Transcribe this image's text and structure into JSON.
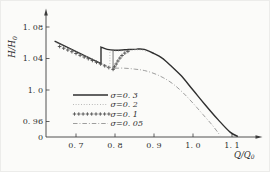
{
  "figure": {
    "background": "#fbfbf9"
  },
  "style": {
    "axis_color": "#3c3c3c",
    "text_color": "#2e2e2e",
    "solid_color": "#2f2f2f",
    "dotted_color": "#a0a0a0",
    "plus_color": "#4f4f4f",
    "dashdot_color": "#8c8c8c"
  },
  "axes": {
    "x": {
      "label": {
        "text": "Q/Q",
        "sub": "0"
      },
      "ticks": [
        {
          "v": 0.7,
          "label": "0. 7"
        },
        {
          "v": 0.8,
          "label": "0. 8"
        },
        {
          "v": 0.9,
          "label": "0. 9"
        },
        {
          "v": 1.0,
          "label": "1. 0"
        },
        {
          "v": 1.1,
          "label": "1. 1"
        }
      ]
    },
    "y": {
      "label": {
        "text": "H/H",
        "sub": "0"
      },
      "ticks": [
        {
          "v": 1.08,
          "label": "1. 08"
        },
        {
          "v": 1.04,
          "label": "1. 04"
        },
        {
          "v": 1.0,
          "label": "1. 0"
        },
        {
          "v": 0.96,
          "label": "0. 96"
        }
      ],
      "origin_label": "0"
    }
  },
  "legend": {
    "entries": [
      {
        "name": "sigma-0-3",
        "style": "solid",
        "label": "σ=0. 3"
      },
      {
        "name": "sigma-0-2",
        "style": "dotted",
        "label": "σ=0. 2"
      },
      {
        "name": "sigma-0-1",
        "style": "plus",
        "label": "σ=0. 1"
      },
      {
        "name": "sigma-0-05",
        "style": "dashdot",
        "label": "σ=0. 05"
      }
    ]
  },
  "chart_data": {
    "type": "line",
    "title": "",
    "xlabel": "Q/Q0",
    "ylabel": "H/H0",
    "x_ticks": [
      0.7,
      0.8,
      0.9,
      1.0,
      1.1
    ],
    "y_ticks": [
      0.96,
      1.0,
      1.04,
      1.08
    ],
    "xlim": [
      0.62,
      1.17
    ],
    "ylim_linear": [
      0.94,
      1.095
    ],
    "y_axis_break_to_zero": true,
    "grid": false,
    "legend_position": "lower-left-inside",
    "series": [
      {
        "name": "σ=0.3",
        "style": "solid",
        "segments": [
          {
            "smooth": false,
            "pts": [
              [
                0.645,
                1.062
              ],
              [
                0.764,
                1.0335
              ]
            ]
          },
          {
            "smooth": false,
            "pts": [
              [
                0.764,
                1.0335
              ],
              [
                0.764,
                1.0545
              ]
            ]
          },
          {
            "smooth": true,
            "pts": [
              [
                0.764,
                1.0545
              ],
              [
                0.78,
                1.0515
              ],
              [
                0.8,
                1.0505
              ],
              [
                0.825,
                1.051
              ],
              [
                0.855,
                1.052
              ],
              [
                0.875,
                1.0515
              ],
              [
                0.9,
                1.0462
              ],
              [
                0.92,
                1.0408
              ],
              [
                0.945,
                1.03
              ],
              [
                0.97,
                1.018
              ],
              [
                1.0,
                1.0
              ],
              [
                1.03,
                0.982
              ],
              [
                1.065,
                0.962
              ],
              [
                1.095,
                0.9465
              ],
              [
                1.115,
                0.941
              ]
            ]
          }
        ]
      },
      {
        "name": "σ=0.2",
        "style": "dotted",
        "segments": [
          {
            "smooth": false,
            "pts": [
              [
                0.65,
                1.0598
              ],
              [
                0.787,
                1.0288
              ]
            ]
          },
          {
            "smooth": false,
            "pts": [
              [
                0.787,
                1.0288
              ],
              [
                0.787,
                1.05
              ]
            ]
          },
          {
            "smooth": true,
            "pts": [
              [
                0.787,
                1.05
              ],
              [
                0.81,
                1.0495
              ],
              [
                0.84,
                1.0505
              ],
              [
                0.865,
                1.051
              ],
              [
                0.885,
                1.0487
              ]
            ]
          }
        ]
      },
      {
        "name": "σ=0.1",
        "style": "plus",
        "points": [
          [
            0.658,
            1.0553
          ],
          [
            0.6685,
            1.0531
          ],
          [
            0.679,
            1.0508
          ],
          [
            0.6895,
            1.0486
          ],
          [
            0.7,
            1.0464
          ],
          [
            0.7105,
            1.0441
          ],
          [
            0.721,
            1.0419
          ],
          [
            0.7315,
            1.0397
          ],
          [
            0.742,
            1.0374
          ],
          [
            0.7525,
            1.0352
          ],
          [
            0.763,
            1.033
          ],
          [
            0.7735,
            1.0307
          ],
          [
            0.784,
            1.0285
          ],
          [
            0.795,
            1.0262
          ],
          [
            0.799,
            1.0295
          ],
          [
            0.803,
            1.033
          ],
          [
            0.8075,
            1.0368
          ],
          [
            0.8125,
            1.0405
          ],
          [
            0.818,
            1.0438
          ],
          [
            0.825,
            1.0468
          ],
          [
            0.833,
            1.049
          ]
        ]
      },
      {
        "name": "σ=0.05",
        "style": "dashdot",
        "segments": [
          {
            "smooth": true,
            "pts": [
              [
                0.776,
                1.0297
              ],
              [
                0.795,
                1.0277
              ],
              [
                0.82,
                1.0278
              ],
              [
                0.85,
                1.0266
              ],
              [
                0.875,
                1.0247
              ],
              [
                0.9,
                1.021
              ],
              [
                0.925,
                1.0152
              ],
              [
                0.95,
                1.0072
              ],
              [
                0.975,
                0.9962
              ],
              [
                1.0,
                0.9832
              ],
              [
                1.025,
                0.9692
              ],
              [
                1.05,
                0.955
              ],
              [
                1.07,
                0.942
              ]
            ]
          }
        ]
      }
    ],
    "aux_vertical": {
      "q": 0.795,
      "h_from": 1.0265,
      "h_to": 1.0503
    }
  }
}
